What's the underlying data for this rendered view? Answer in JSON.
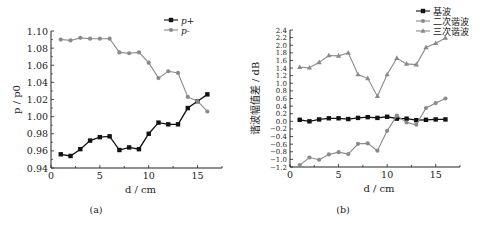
{
  "chart_data": [
    {
      "id": "a",
      "type": "line",
      "caption": "(a)",
      "title": "",
      "xlabel": "d / cm",
      "ylabel": "p / p0",
      "xlim": [
        0,
        17.5
      ],
      "ylim": [
        0.94,
        1.1
      ],
      "xticks": [
        0,
        5,
        10,
        15
      ],
      "yticks": [
        0.94,
        0.96,
        0.98,
        1.0,
        1.02,
        1.04,
        1.06,
        1.08,
        1.1
      ],
      "ytick_labels": [
        "0.94",
        "0.96",
        "0.98",
        "1.00",
        "1.02",
        "1.04",
        "1.06",
        "1.08",
        "1.10"
      ],
      "grid": false,
      "legend_position": "top-right",
      "x": [
        1,
        2,
        3,
        4,
        5,
        6,
        7,
        8,
        9,
        10,
        11,
        12,
        13,
        14,
        15,
        16
      ],
      "series": [
        {
          "name": "p+",
          "marker": "square",
          "color": "#111111",
          "values": [
            0.956,
            0.954,
            0.962,
            0.972,
            0.976,
            0.977,
            0.961,
            0.964,
            0.962,
            0.98,
            0.993,
            0.991,
            0.991,
            1.01,
            1.018,
            1.026
          ]
        },
        {
          "name": "p-",
          "marker": "circle",
          "color": "#8a8a8a",
          "values": [
            1.09,
            1.089,
            1.092,
            1.091,
            1.091,
            1.091,
            1.075,
            1.074,
            1.075,
            1.063,
            1.045,
            1.053,
            1.051,
            1.023,
            1.018,
            1.006
          ]
        }
      ]
    },
    {
      "id": "b",
      "type": "line",
      "caption": "(b)",
      "title": "",
      "xlabel": "d / cm",
      "ylabel": "谐波幅值差 / dB",
      "xlim": [
        0,
        17.5
      ],
      "ylim": [
        -1.2,
        2.4
      ],
      "xticks": [
        0,
        5,
        10,
        15
      ],
      "yticks": [
        -1.2,
        -1.0,
        -0.8,
        -0.6,
        -0.4,
        -0.2,
        0.0,
        0.2,
        0.4,
        0.6,
        0.8,
        1.0,
        1.2,
        1.4,
        1.6,
        1.8,
        2.0,
        2.2,
        2.4
      ],
      "ytick_labels": [
        "−1.2",
        "−1.0",
        "−0.8",
        "−0.6",
        "−0.4",
        "−0.2",
        "0.0",
        "0.2",
        "0.4",
        "0.6",
        "0.8",
        "1.0",
        "1.2",
        "1.4",
        "1.6",
        "1.8",
        "2.0",
        "2.2",
        "2.4"
      ],
      "grid": false,
      "legend_position": "top-right",
      "x": [
        1,
        2,
        3,
        4,
        5,
        6,
        7,
        8,
        9,
        10,
        11,
        12,
        13,
        14,
        15,
        16
      ],
      "series": [
        {
          "name": "基波",
          "marker": "square",
          "color": "#111111",
          "values": [
            0.04,
            0.0,
            0.05,
            0.08,
            0.08,
            0.06,
            0.09,
            0.11,
            0.09,
            0.12,
            0.07,
            0.07,
            0.03,
            0.04,
            0.05,
            0.05
          ]
        },
        {
          "name": "二次谐波",
          "marker": "circle",
          "color": "#8a8a8a",
          "values": [
            -1.15,
            -0.95,
            -1.01,
            -0.87,
            -0.81,
            -0.86,
            -0.59,
            -0.58,
            -0.77,
            -0.25,
            0.15,
            -0.03,
            -0.09,
            0.35,
            0.48,
            0.6
          ]
        },
        {
          "name": "三次谐波",
          "marker": "triangle",
          "color": "#8a8a8a",
          "values": [
            1.42,
            1.41,
            1.55,
            1.73,
            1.72,
            1.8,
            1.23,
            1.13,
            0.66,
            1.23,
            1.66,
            1.51,
            1.49,
            1.94,
            2.05,
            2.19
          ]
        }
      ]
    }
  ]
}
